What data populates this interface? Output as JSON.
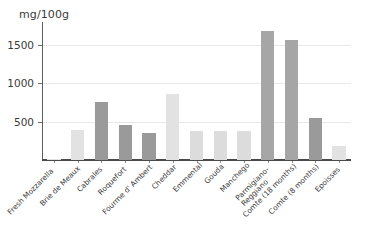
{
  "chart_data": {
    "type": "bar",
    "title": "",
    "subtitle": "",
    "xlabel": "",
    "ylabel": "mg/100g",
    "unit_caption": "mg/100g",
    "ylim": [
      0,
      1800
    ],
    "grid": true,
    "legend": false,
    "legend_position": "none",
    "yticks": [
      500,
      1000,
      1500
    ],
    "ytick_labels": [
      "500",
      "1000",
      "1500"
    ],
    "categories": [
      "Fresh Mozzarella",
      "Brie de Meaux",
      "Cabrales",
      "Roquefort",
      "Fourme d' Ambert",
      "Cheddar",
      "Emmental",
      "Gouda",
      "Manchego",
      "Parmigiano-\nReggiano",
      "Comte (18 months)",
      "Comte (8 months)",
      "Epoisses"
    ],
    "values": [
      10,
      390,
      760,
      460,
      350,
      860,
      375,
      375,
      375,
      1680,
      1560,
      550,
      180
    ],
    "bar_colors": [
      "#e2e2e2",
      "#e2e2e2",
      "#9a9a9a",
      "#9a9a9a",
      "#9a9a9a",
      "#e2e2e2",
      "#dcdcdc",
      "#dcdcdc",
      "#dcdcdc",
      "#a6a6a6",
      "#a6a6a6",
      "#9a9a9a",
      "#e2e2e2"
    ],
    "axis_color": "#4a4a4a",
    "grid_color": "#e8e8e8",
    "text_color": "#3a3a3a",
    "background": "#ffffff"
  }
}
